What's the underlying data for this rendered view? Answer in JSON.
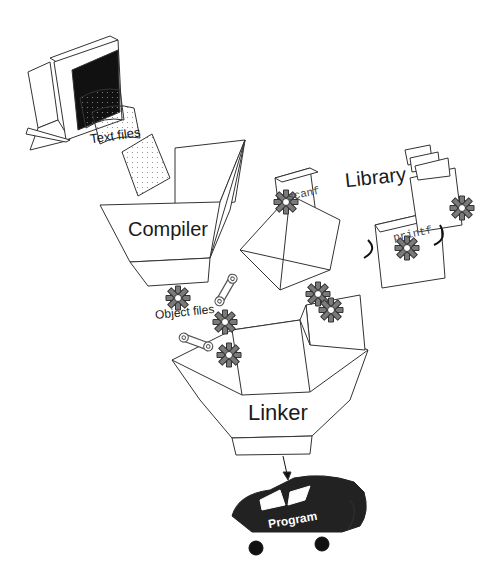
{
  "diagram": {
    "type": "compile-link-process",
    "nodes": [
      {
        "id": "computer",
        "label": ""
      },
      {
        "id": "text_files",
        "label": "Text files"
      },
      {
        "id": "compiler",
        "label": "Compiler"
      },
      {
        "id": "object_files",
        "label": "Object files"
      },
      {
        "id": "library",
        "label": "Library"
      },
      {
        "id": "scanf",
        "label": "scanf"
      },
      {
        "id": "printf",
        "label": "printf"
      },
      {
        "id": "linker",
        "label": "Linker"
      },
      {
        "id": "program",
        "label": "Program"
      }
    ],
    "edges": [
      {
        "from": "computer",
        "to": "compiler",
        "via": "text_files"
      },
      {
        "from": "compiler",
        "to": "linker",
        "via": "object_files"
      },
      {
        "from": "library",
        "to": "linker"
      },
      {
        "from": "linker",
        "to": "program"
      }
    ]
  },
  "labels": {
    "text_files": "Text files",
    "compiler": "Compiler",
    "object_files": "Object files",
    "library": "Library",
    "scanf": "scanf",
    "printf": "printf",
    "linker": "Linker",
    "program": "Program"
  },
  "colors": {
    "line": "#333333",
    "gear": "#7a7a7a",
    "car": "#222222",
    "screen": "#111111"
  }
}
